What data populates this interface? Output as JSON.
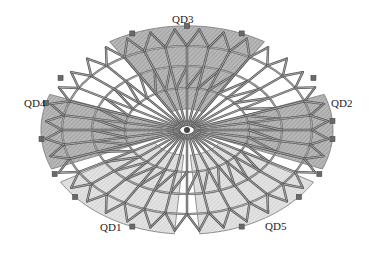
{
  "figure": {
    "type": "plan view of radial spoke-wheel / cable-dome roof structure",
    "center": [
      187,
      130
    ],
    "colors": {
      "background": "#ffffff",
      "member": "#7a7a7a",
      "member_edge": "#555555",
      "ring": "#6e6e6e",
      "zone_dark": "#b4b4b4",
      "zone_light": "#dcdcdc",
      "hatch": "#8c8c8c",
      "support": "#6a6a6a",
      "label": "#222222"
    }
  },
  "zones": [
    {
      "id": "QD1",
      "label": "QD1",
      "shade": "light",
      "position": "bottom-left",
      "label_xy": [
        100,
        222
      ]
    },
    {
      "id": "QD2",
      "label": "QD2",
      "shade": "dark",
      "position": "right",
      "label_xy": [
        331,
        98
      ]
    },
    {
      "id": "QD3",
      "label": "QD3",
      "shade": "dark",
      "position": "top",
      "label_xy": [
        172,
        14
      ]
    },
    {
      "id": "QD4",
      "label": "QD4",
      "shade": "dark",
      "position": "left",
      "label_xy": [
        24,
        98
      ]
    },
    {
      "id": "QD5",
      "label": "QD5",
      "shade": "light",
      "position": "bottom-right",
      "label_xy": [
        265,
        221
      ]
    }
  ],
  "structure": {
    "spoke_count": 36,
    "rings": [
      {
        "name": "hub",
        "rx": 14,
        "ry": 9
      },
      {
        "name": "inner-ring",
        "rx": 62,
        "ry": 42
      },
      {
        "name": "middle-ring",
        "rx": 95,
        "ry": 64
      },
      {
        "name": "outer-ring",
        "rx": 125,
        "ry": 84
      }
    ],
    "outer_tip": {
      "rx": 157,
      "ry": 112
    }
  }
}
